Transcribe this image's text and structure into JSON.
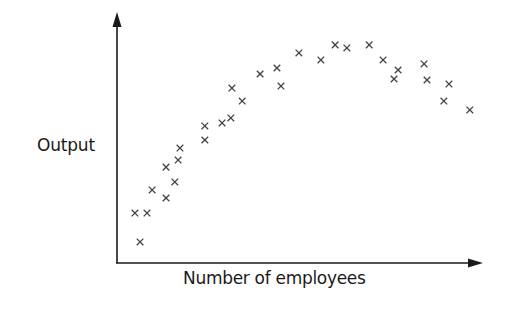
{
  "chart_data": {
    "type": "scatter",
    "title": "",
    "xlabel": "Number of employees",
    "ylabel": "Output",
    "xlim": [
      0,
      100
    ],
    "ylim": [
      0,
      100
    ],
    "grid": false,
    "legend": null,
    "ticks": {
      "x": [],
      "y": []
    },
    "marker": "x",
    "marker_color": "#444444",
    "axis_color": "#1a1a1a",
    "note": "No numeric axis ticks shown; values are relative positions (0-100) along each axis.",
    "series": [
      {
        "name": "observations",
        "points": [
          [
            4.9,
            19.9
          ],
          [
            8.2,
            19.9
          ],
          [
            6.3,
            8.4
          ],
          [
            9.6,
            29.1
          ],
          [
            13.4,
            25.9
          ],
          [
            13.4,
            38.2
          ],
          [
            15.8,
            32.3
          ],
          [
            16.7,
            41.0
          ],
          [
            17.2,
            45.8
          ],
          [
            24.0,
            54.6
          ],
          [
            24.0,
            49.0
          ],
          [
            28.7,
            55.8
          ],
          [
            31.1,
            57.8
          ],
          [
            31.4,
            69.7
          ],
          [
            34.2,
            64.5
          ],
          [
            39.1,
            75.3
          ],
          [
            43.7,
            77.7
          ],
          [
            44.8,
            70.5
          ],
          [
            49.7,
            83.7
          ],
          [
            55.7,
            80.9
          ],
          [
            59.6,
            86.9
          ],
          [
            62.8,
            85.7
          ],
          [
            68.9,
            86.9
          ],
          [
            72.7,
            80.9
          ],
          [
            76.8,
            76.9
          ],
          [
            75.7,
            73.3
          ],
          [
            83.9,
            79.3
          ],
          [
            84.7,
            72.9
          ],
          [
            90.7,
            71.3
          ],
          [
            89.3,
            64.5
          ],
          [
            96.4,
            61.0
          ]
        ]
      }
    ]
  }
}
